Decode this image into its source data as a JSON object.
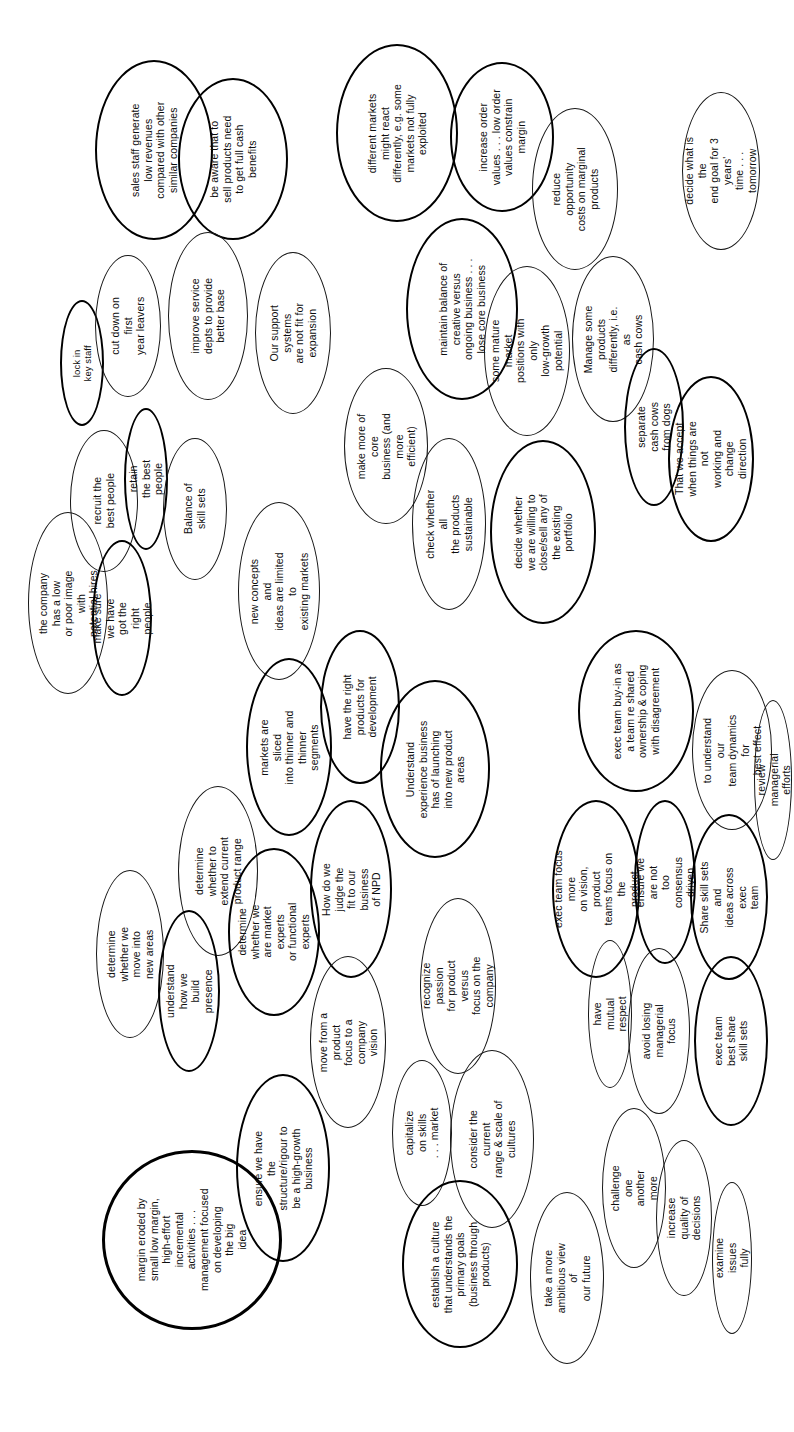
{
  "document": {
    "title": "Idea ovals diagram",
    "orientation": "landscape-rotated-90",
    "background_color": "#ffffff",
    "ink_color": "#171717",
    "shape_type": "ellipse"
  },
  "ovals": [
    {
      "id": "o01",
      "text": "sales staff generate\nlow revenues\ncompared with other\nsimilar companies",
      "weight": "bold"
    },
    {
      "id": "o02",
      "text": "be aware that to\nsell products need\nto get full cash\nbenefits",
      "weight": "bold"
    },
    {
      "id": "o03",
      "text": "lock in key staff",
      "weight": "bold"
    },
    {
      "id": "o04",
      "text": "cut down on first\nyear leavers",
      "weight": "normal"
    },
    {
      "id": "o05",
      "text": "improve service\ndepts to provide\nbetter base",
      "weight": "normal"
    },
    {
      "id": "o06",
      "text": "Our support systems\nare not fit for\nexpansion",
      "weight": "normal"
    },
    {
      "id": "o07",
      "text": "recruit the\nbest people",
      "weight": "normal"
    },
    {
      "id": "o08",
      "text": "retain the best people",
      "weight": "bold"
    },
    {
      "id": "o09",
      "text": "Balance of\nskill sets",
      "weight": "normal"
    },
    {
      "id": "o10",
      "text": "the company has a low\nor poor image with\npotential hires",
      "weight": "normal"
    },
    {
      "id": "o11",
      "text": "make sure we have\ngot the right people",
      "weight": "bold"
    },
    {
      "id": "o12",
      "text": "different markets\nmight react\ndifferently, e.g. some\nmarkets not fully\nexploited",
      "weight": "bold"
    },
    {
      "id": "o13",
      "text": "increase order\nvalues . . . low order\nvalues constrain\nmargin",
      "weight": "bold"
    },
    {
      "id": "o14",
      "text": "reduce opportunity\ncosts on marginal\nproducts",
      "weight": "normal"
    },
    {
      "id": "o15",
      "text": "maintain balance of\ncreative versus\nongoing business . . .\nlose core business",
      "weight": "bold"
    },
    {
      "id": "o16",
      "text": "make more of core\nbusiness (and more\nefficient)",
      "weight": "normal"
    },
    {
      "id": "o17",
      "text": "some mature market\npositions with only\nlow-growth potential",
      "weight": "normal"
    },
    {
      "id": "o18",
      "text": "Manage some products\ndifferently, i.e. as\ncash cows",
      "weight": "normal"
    },
    {
      "id": "o19",
      "text": "separate cash cows\nfrom dogs",
      "weight": "bold"
    },
    {
      "id": "o20",
      "text": "That we accept\nwhen things are not\nworking and change\ndirection",
      "weight": "bold"
    },
    {
      "id": "o21",
      "text": "decide what is the\nend goal for 3 years'\ntime . . . tomorrow",
      "weight": "normal"
    },
    {
      "id": "o22",
      "text": "check whether all\nthe products\nsustainable",
      "weight": "normal"
    },
    {
      "id": "o23",
      "text": "decide whether\nwe are willing to\nclose/sell any of\nthe existing\nportfolio",
      "weight": "bold"
    },
    {
      "id": "o24",
      "text": "new concepts and\nideas are limited to\nexisting markets",
      "weight": "normal"
    },
    {
      "id": "o25",
      "text": "markets are sliced\ninto thinner and\nthinner segments",
      "weight": "bold"
    },
    {
      "id": "o26",
      "text": "have the right\nproducts for\ndevelopment",
      "weight": "bold"
    },
    {
      "id": "o27",
      "text": "Understand\nexperience business\nhas of launching\ninto new product\nareas",
      "weight": "bold"
    },
    {
      "id": "o28",
      "text": "determine whether to\nextend current\nproduct range",
      "weight": "normal"
    },
    {
      "id": "o29",
      "text": "determine whether we\nmove into new areas",
      "weight": "normal"
    },
    {
      "id": "o30",
      "text": "understand how we\nbuild presence",
      "weight": "bold"
    },
    {
      "id": "o31",
      "text": "determine whether we\nare market experts\nor functional\nexperts",
      "weight": "bold"
    },
    {
      "id": "o32",
      "text": "How do we judge the\nfit to our business\nof NPD",
      "weight": "bold"
    },
    {
      "id": "o33",
      "text": "move from a product\nfocus to a company\nvision",
      "weight": "normal"
    },
    {
      "id": "o34",
      "text": "recognize passion\nfor product versus\nfocus on the company",
      "weight": "normal"
    },
    {
      "id": "o35",
      "text": "capitalize on skills\n. . . market",
      "weight": "normal"
    },
    {
      "id": "o36",
      "text": "consider the current\nrange & scale of\ncultures",
      "weight": "normal"
    },
    {
      "id": "o37",
      "text": "margin eroded by\nsmall low margin,\nhigh-effort\nincremental\nactivities . . .\nmanagement focused\non developing\nthe big\nidea",
      "weight": "xbold"
    },
    {
      "id": "o38",
      "text": "ensure we have the\nstructure/rigour to\nbe a high-growth\nbusiness",
      "weight": "bold"
    },
    {
      "id": "o39",
      "text": "establish a culture\nthat understands the\nprimary goals\n(business through\nproducts)",
      "weight": "bold"
    },
    {
      "id": "o40",
      "text": "take a more\nambitious view of\nour future",
      "weight": "normal"
    },
    {
      "id": "o41",
      "text": "exec team buy-in as\na team re shared\nownership & coping\nwith disagreement",
      "weight": "bold"
    },
    {
      "id": "o42",
      "text": "to understand our\nteam dynamics for\nbest effect",
      "weight": "normal"
    },
    {
      "id": "o43",
      "text": "review managerial efforts",
      "weight": "normal"
    },
    {
      "id": "o44",
      "text": "exec team focus more\non vision, product\nteams focus on the\nproduct",
      "weight": "bold"
    },
    {
      "id": "o45",
      "text": "ensure we are not\ntoo consensus driven",
      "weight": "bold"
    },
    {
      "id": "o46",
      "text": "Share skill sets and\nideas across exec\nteam",
      "weight": "bold"
    },
    {
      "id": "o47",
      "text": "have mutual respect",
      "weight": "normal"
    },
    {
      "id": "o48",
      "text": "avoid losing\nmanagerial focus",
      "weight": "normal"
    },
    {
      "id": "o49",
      "text": "exec team best share\nskill sets",
      "weight": "bold"
    },
    {
      "id": "o50",
      "text": "challenge one\nanother more",
      "weight": "normal"
    },
    {
      "id": "o51",
      "text": "increase quality of\ndecisions",
      "weight": "normal"
    },
    {
      "id": "o52",
      "text": "examine issues fully",
      "weight": "normal"
    }
  ],
  "layout": {
    "o01": {
      "x": 95,
      "y": 60,
      "w": 118,
      "h": 180,
      "size": "m"
    },
    "o02": {
      "x": 178,
      "y": 78,
      "w": 110,
      "h": 162,
      "size": "m"
    },
    "o03": {
      "x": 60,
      "y": 300,
      "w": 44,
      "h": 126,
      "size": "s"
    },
    "o04": {
      "x": 95,
      "y": 255,
      "w": 66,
      "h": 142,
      "size": "m"
    },
    "o05": {
      "x": 168,
      "y": 232,
      "w": 80,
      "h": 168,
      "size": "m"
    },
    "o06": {
      "x": 255,
      "y": 252,
      "w": 76,
      "h": 162,
      "size": "m"
    },
    "o07": {
      "x": 70,
      "y": 430,
      "w": 68,
      "h": 142,
      "size": "m"
    },
    "o08": {
      "x": 124,
      "y": 408,
      "w": 44,
      "h": 142,
      "size": "m"
    },
    "o09": {
      "x": 163,
      "y": 438,
      "w": 64,
      "h": 142,
      "size": "m"
    },
    "o10": {
      "x": 28,
      "y": 512,
      "w": 80,
      "h": 182,
      "size": "m"
    },
    "o11": {
      "x": 92,
      "y": 540,
      "w": 60,
      "h": 156,
      "size": "m"
    },
    "o12": {
      "x": 336,
      "y": 44,
      "w": 122,
      "h": 178,
      "size": "m"
    },
    "o13": {
      "x": 450,
      "y": 62,
      "w": 104,
      "h": 150,
      "size": "m"
    },
    "o14": {
      "x": 532,
      "y": 108,
      "w": 86,
      "h": 162,
      "size": "m"
    },
    "o15": {
      "x": 406,
      "y": 218,
      "w": 112,
      "h": 182,
      "size": "m"
    },
    "o16": {
      "x": 344,
      "y": 368,
      "w": 84,
      "h": 156,
      "size": "m"
    },
    "o17": {
      "x": 484,
      "y": 266,
      "w": 86,
      "h": 170,
      "size": "m"
    },
    "o18": {
      "x": 572,
      "y": 256,
      "w": 82,
      "h": 166,
      "size": "m"
    },
    "o19": {
      "x": 624,
      "y": 348,
      "w": 60,
      "h": 158,
      "size": "m"
    },
    "o20": {
      "x": 668,
      "y": 376,
      "w": 86,
      "h": 166,
      "size": "m"
    },
    "o21": {
      "x": 682,
      "y": 92,
      "w": 78,
      "h": 158,
      "size": "m"
    },
    "o22": {
      "x": 412,
      "y": 438,
      "w": 74,
      "h": 172,
      "size": "m"
    },
    "o23": {
      "x": 490,
      "y": 440,
      "w": 106,
      "h": 184,
      "size": "m"
    },
    "o24": {
      "x": 238,
      "y": 502,
      "w": 82,
      "h": 178,
      "size": "m"
    },
    "o25": {
      "x": 246,
      "y": 658,
      "w": 86,
      "h": 178,
      "size": "m"
    },
    "o26": {
      "x": 320,
      "y": 630,
      "w": 80,
      "h": 154,
      "size": "m"
    },
    "o27": {
      "x": 380,
      "y": 680,
      "w": 110,
      "h": 178,
      "size": "m"
    },
    "o28": {
      "x": 178,
      "y": 786,
      "w": 80,
      "h": 170,
      "size": "m"
    },
    "o29": {
      "x": 96,
      "y": 870,
      "w": 68,
      "h": 168,
      "size": "m"
    },
    "o30": {
      "x": 158,
      "y": 910,
      "w": 62,
      "h": 162,
      "size": "m"
    },
    "o31": {
      "x": 228,
      "y": 848,
      "w": 92,
      "h": 168,
      "size": "m"
    },
    "o32": {
      "x": 310,
      "y": 800,
      "w": 82,
      "h": 178,
      "size": "m"
    },
    "o33": {
      "x": 310,
      "y": 956,
      "w": 76,
      "h": 172,
      "size": "m"
    },
    "o34": {
      "x": 420,
      "y": 898,
      "w": 76,
      "h": 176,
      "size": "m"
    },
    "o35": {
      "x": 392,
      "y": 1060,
      "w": 60,
      "h": 146,
      "size": "m"
    },
    "o36": {
      "x": 450,
      "y": 1050,
      "w": 84,
      "h": 178,
      "size": "m"
    },
    "o37": {
      "x": 102,
      "y": 1150,
      "w": 180,
      "h": 180,
      "size": "m"
    },
    "o38": {
      "x": 236,
      "y": 1074,
      "w": 94,
      "h": 188,
      "size": "m"
    },
    "o39": {
      "x": 402,
      "y": 1180,
      "w": 116,
      "h": 168,
      "size": "m"
    },
    "o40": {
      "x": 530,
      "y": 1192,
      "w": 74,
      "h": 172,
      "size": "m"
    },
    "o41": {
      "x": 578,
      "y": 630,
      "w": 116,
      "h": 162,
      "size": "m"
    },
    "o42": {
      "x": 692,
      "y": 670,
      "w": 80,
      "h": 160,
      "size": "m"
    },
    "o43": {
      "x": 754,
      "y": 700,
      "w": 38,
      "h": 160,
      "size": "m"
    },
    "o44": {
      "x": 552,
      "y": 800,
      "w": 88,
      "h": 178,
      "size": "m"
    },
    "o45": {
      "x": 634,
      "y": 800,
      "w": 62,
      "h": 164,
      "size": "m"
    },
    "o46": {
      "x": 690,
      "y": 814,
      "w": 78,
      "h": 166,
      "size": "m"
    },
    "o47": {
      "x": 588,
      "y": 940,
      "w": 44,
      "h": 148,
      "size": "m"
    },
    "o48": {
      "x": 628,
      "y": 948,
      "w": 62,
      "h": 166,
      "size": "m"
    },
    "o49": {
      "x": 694,
      "y": 956,
      "w": 74,
      "h": 170,
      "size": "m"
    },
    "o50": {
      "x": 602,
      "y": 1108,
      "w": 64,
      "h": 160,
      "size": "m"
    },
    "o51": {
      "x": 656,
      "y": 1140,
      "w": 56,
      "h": 156,
      "size": "m"
    },
    "o52": {
      "x": 712,
      "y": 1182,
      "w": 40,
      "h": 152,
      "size": "m"
    }
  }
}
